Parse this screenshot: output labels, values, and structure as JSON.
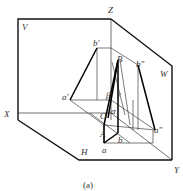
{
  "figure": {
    "caption": "(a)",
    "planes": {
      "V": "V",
      "H": "H",
      "W": "W"
    },
    "axes": {
      "X": "X",
      "Y": "Y",
      "Z": "Z"
    },
    "points": {
      "b_prime": "b'",
      "b_double_prime": "b\"",
      "a_prime": "a'",
      "a_double_prime": "a\"",
      "a": "a",
      "b": "b",
      "A": "A",
      "B": "B",
      "O": "O"
    },
    "angles": {
      "alpha": "α",
      "beta": "β",
      "gamma": "γ"
    }
  }
}
